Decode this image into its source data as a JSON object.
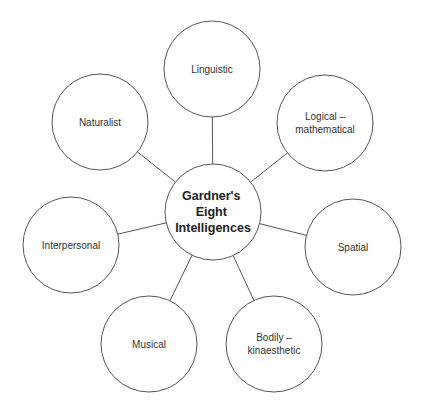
{
  "diagram": {
    "type": "mind-map",
    "center": {
      "lines": [
        "Gardner's",
        "Eight",
        "Intelligences"
      ],
      "cx": 213,
      "cy": 212,
      "r": 48
    },
    "nodes": [
      {
        "id": "linguistic",
        "lines": [
          "Linguistic"
        ],
        "cx": 212,
        "cy": 69,
        "r": 48
      },
      {
        "id": "logical-mathematical",
        "lines": [
          "Logical –",
          "mathematical"
        ],
        "cx": 325,
        "cy": 123,
        "r": 48
      },
      {
        "id": "spatial",
        "lines": [
          "Spatial"
        ],
        "cx": 353,
        "cy": 247,
        "r": 48
      },
      {
        "id": "bodily-kinaesthetic",
        "lines": [
          "Bodily –",
          "kinaesthetic"
        ],
        "cx": 274,
        "cy": 344,
        "r": 48
      },
      {
        "id": "musical",
        "lines": [
          "Musical"
        ],
        "cx": 149,
        "cy": 344,
        "r": 48
      },
      {
        "id": "interpersonal",
        "lines": [
          "Interpersonal"
        ],
        "cx": 71,
        "cy": 245,
        "r": 48
      },
      {
        "id": "naturalist",
        "lines": [
          "Naturalist"
        ],
        "cx": 100,
        "cy": 122,
        "r": 48
      }
    ],
    "colors": {
      "stroke": "#555555",
      "text": "#333333",
      "background": "#ffffff"
    }
  }
}
